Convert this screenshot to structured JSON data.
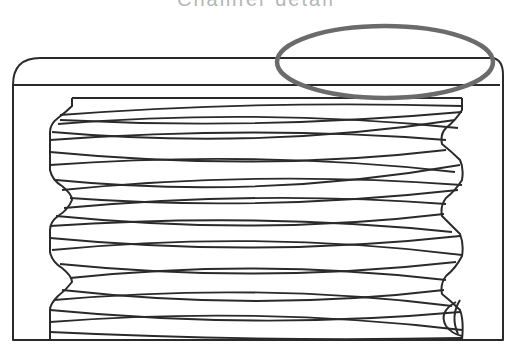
{
  "figure": {
    "title_partial": "Chamfer detail",
    "colors": {
      "line": "#2a2a2a",
      "highlight_ellipse": "#6b6b6b",
      "title": "#b5b5b5",
      "background": "#ffffff"
    },
    "highlight": {
      "shape": "ellipse",
      "cx": 385,
      "cy": 62,
      "rx": 108,
      "ry": 36
    },
    "thread": {
      "crests": 3,
      "pitch_px": 82
    }
  }
}
